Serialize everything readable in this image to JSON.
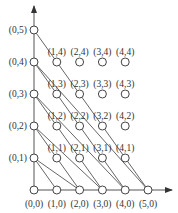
{
  "diagram": {
    "type": "lattice-graph",
    "axes": {
      "x_arrow": true,
      "y_arrow": true
    },
    "nodes": [
      {
        "id": "0,0",
        "label": "(0,0)",
        "i": 0,
        "j": 0
      },
      {
        "id": "1,0",
        "label": "(1,0)",
        "i": 1,
        "j": 0
      },
      {
        "id": "2,0",
        "label": "(2,0)",
        "i": 2,
        "j": 0
      },
      {
        "id": "3,0",
        "label": "(3,0)",
        "i": 3,
        "j": 0
      },
      {
        "id": "4,0",
        "label": "(4,0)",
        "i": 4,
        "j": 0
      },
      {
        "id": "5,0",
        "label": "(5,0)",
        "i": 5,
        "j": 0
      },
      {
        "id": "0,1",
        "label": "(0,1)",
        "i": 0,
        "j": 1
      },
      {
        "id": "1,1",
        "label": "(1,1)",
        "i": 1,
        "j": 1
      },
      {
        "id": "2,1",
        "label": "(2,1)",
        "i": 2,
        "j": 1
      },
      {
        "id": "3,1",
        "label": "(3,1)",
        "i": 3,
        "j": 1
      },
      {
        "id": "4,1",
        "label": "(4,1)",
        "i": 4,
        "j": 1
      },
      {
        "id": "0,2",
        "label": "(0,2)",
        "i": 0,
        "j": 2
      },
      {
        "id": "1,2",
        "label": "(1,2)",
        "i": 1,
        "j": 2
      },
      {
        "id": "2,2",
        "label": "(2,2)",
        "i": 2,
        "j": 2
      },
      {
        "id": "3,2",
        "label": "(3,2)",
        "i": 3,
        "j": 2
      },
      {
        "id": "4,2",
        "label": "(4,2)",
        "i": 4,
        "j": 2
      },
      {
        "id": "0,3",
        "label": "(0,3)",
        "i": 0,
        "j": 3
      },
      {
        "id": "1,3",
        "label": "(1,3)",
        "i": 1,
        "j": 3
      },
      {
        "id": "2,3",
        "label": "(2,3)",
        "i": 2,
        "j": 3
      },
      {
        "id": "3,3",
        "label": "(3,3)",
        "i": 3,
        "j": 3
      },
      {
        "id": "4,3",
        "label": "(4,3)",
        "i": 4,
        "j": 3
      },
      {
        "id": "0,4",
        "label": "(0,4)",
        "i": 0,
        "j": 4
      },
      {
        "id": "1,4",
        "label": "(1,4)",
        "i": 1,
        "j": 4
      },
      {
        "id": "2,4",
        "label": "(2,4)",
        "i": 2,
        "j": 4
      },
      {
        "id": "3,4",
        "label": "(3,4)",
        "i": 3,
        "j": 4
      },
      {
        "id": "4,4",
        "label": "(4,4)",
        "i": 4,
        "j": 4
      },
      {
        "id": "0,5",
        "label": "(0,5)",
        "i": 0,
        "j": 5
      }
    ],
    "edges": [
      {
        "from": "0,5",
        "to": "5,0"
      },
      {
        "from": "0,4",
        "to": "4,0"
      },
      {
        "from": "0,4",
        "to": "5,0"
      },
      {
        "from": "0,3",
        "to": "3,0"
      },
      {
        "from": "0,3",
        "to": "4,0"
      },
      {
        "from": "0,2",
        "to": "2,0"
      },
      {
        "from": "0,2",
        "to": "3,0"
      },
      {
        "from": "0,1",
        "to": "1,0"
      },
      {
        "from": "0,1",
        "to": "2,0"
      }
    ]
  }
}
